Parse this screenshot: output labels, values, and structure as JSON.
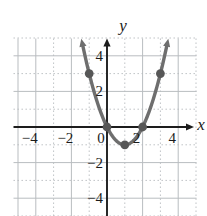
{
  "figure": {
    "colors": {
      "axis": "#1d1d1d",
      "grid": "#b9bdc0",
      "curve": "#6e6e6e",
      "point": "#575757",
      "label": "#1b1b1b",
      "background": "#ffffff"
    }
  },
  "chart_data": {
    "type": "line",
    "title": "",
    "xlabel": "x",
    "ylabel": "y",
    "xlim": [
      -5,
      5
    ],
    "ylim": [
      -5,
      5
    ],
    "grid": "on",
    "grid_step": 1,
    "major_grid_step": 2,
    "x_ticks": [
      {
        "value": -4,
        "label": "−4"
      },
      {
        "value": -2,
        "label": "−2"
      },
      {
        "value": 0,
        "label": "0"
      },
      {
        "value": 2,
        "label": "2"
      },
      {
        "value": 4,
        "label": "4"
      }
    ],
    "y_ticks": [
      {
        "value": 4,
        "label": "4"
      },
      {
        "value": 2,
        "label": "2"
      },
      {
        "value": -2,
        "label": "−2"
      },
      {
        "value": -4,
        "label": "−4"
      }
    ],
    "curve": {
      "kind": "parabola",
      "vertex": [
        1,
        -1
      ],
      "leading_coefficient": 1,
      "x_drawn_range": [
        -1.35,
        3.35
      ],
      "arrow_ends": true
    },
    "marked_points": [
      [
        -1,
        3
      ],
      [
        0,
        0
      ],
      [
        1,
        -1
      ],
      [
        2,
        0
      ],
      [
        3,
        3
      ]
    ],
    "axis_arrows": {
      "x_axis": "right",
      "y_axis": "top"
    }
  }
}
